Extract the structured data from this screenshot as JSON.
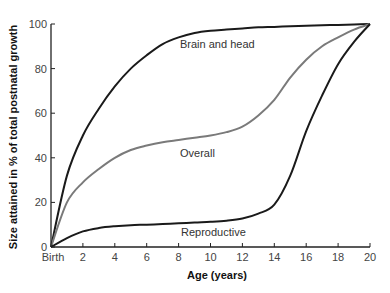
{
  "chart_data": {
    "type": "line",
    "title": "",
    "xlabel": "Age (years)",
    "ylabel": "Size attained in % of total postnatal growth",
    "xlim": [
      0,
      20
    ],
    "ylim": [
      0,
      100
    ],
    "grid": false,
    "legend": "inline labels on curves",
    "x_ticks": [
      {
        "value": 0,
        "label": "Birth"
      },
      {
        "value": 2,
        "label": "2"
      },
      {
        "value": 4,
        "label": "4"
      },
      {
        "value": 6,
        "label": "6"
      },
      {
        "value": 8,
        "label": "8"
      },
      {
        "value": 10,
        "label": "10"
      },
      {
        "value": 12,
        "label": "12"
      },
      {
        "value": 14,
        "label": "14"
      },
      {
        "value": 16,
        "label": "16"
      },
      {
        "value": 18,
        "label": "18"
      },
      {
        "value": 20,
        "label": "20"
      }
    ],
    "y_ticks": [
      {
        "value": 0,
        "label": "0"
      },
      {
        "value": 20,
        "label": "20"
      },
      {
        "value": 40,
        "label": "40"
      },
      {
        "value": 60,
        "label": "60"
      },
      {
        "value": 80,
        "label": "80"
      },
      {
        "value": 100,
        "label": "100"
      }
    ],
    "x": [
      0,
      1,
      2,
      3,
      4,
      5,
      6,
      7,
      8,
      9,
      10,
      11,
      12,
      13,
      14,
      15,
      16,
      17,
      18,
      19,
      20
    ],
    "series": [
      {
        "name": "Brain and head",
        "color": "#1a1a1a",
        "values": [
          0,
          32,
          50,
          62,
          72,
          80,
          86,
          91,
          94,
          96,
          97,
          97.5,
          98,
          98.5,
          98.7,
          99,
          99.2,
          99.4,
          99.6,
          99.8,
          100
        ]
      },
      {
        "name": "Overall",
        "color": "#7a7a7a",
        "values": [
          0,
          20,
          29,
          35,
          40,
          43.5,
          45.5,
          47,
          48,
          49,
          50,
          51.5,
          54,
          59,
          66,
          76,
          84,
          90,
          94,
          97.5,
          100
        ]
      },
      {
        "name": "Reproductive",
        "color": "#1a1a1a",
        "values": [
          0,
          4,
          7,
          8.5,
          9.3,
          9.8,
          10,
          10.3,
          10.6,
          11,
          11.3,
          11.8,
          12.8,
          15,
          19,
          32,
          52,
          68,
          82,
          92,
          100
        ]
      }
    ],
    "annotations": [
      {
        "text": "Brain and head",
        "x": 7.9,
        "y": 91
      },
      {
        "text": "Overall",
        "x": 8.0,
        "y": 40
      },
      {
        "text": "Reproductive",
        "x": 8.1,
        "y": 5
      }
    ]
  },
  "labels": {
    "ylabel": "Size attained in % of total postnatal growth",
    "xlabel": "Age (years)",
    "brain": "Brain and head",
    "overall": "Overall",
    "reproductive": "Reproductive"
  }
}
